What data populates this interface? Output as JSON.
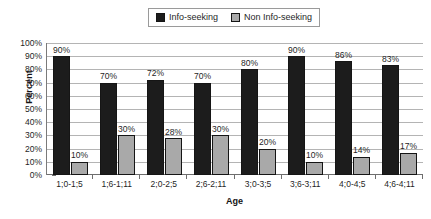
{
  "chart_data": {
    "type": "bar",
    "title": "",
    "xlabel": "Age",
    "ylabel": "Percent",
    "ylim": [
      0,
      100
    ],
    "grid": true,
    "legend_position": "top",
    "categories": [
      "1;0-1;5",
      "1;6-1;11",
      "2;0-2;5",
      "2;6-2;11",
      "3;0-3;5",
      "3;6-3;11",
      "4;0-4;5",
      "4;6-4;11"
    ],
    "ytick_labels": [
      "100%",
      "90%",
      "80%",
      "70%",
      "60%",
      "50%",
      "40%",
      "30%",
      "20%",
      "10%",
      "0%"
    ],
    "ytick_values": [
      100,
      90,
      80,
      70,
      60,
      50,
      40,
      30,
      20,
      10,
      0
    ],
    "series": [
      {
        "name": "Info-seeking",
        "color": "#1c1c1c",
        "values": [
          90,
          70,
          72,
          70,
          80,
          90,
          86,
          83
        ],
        "labels": [
          "90%",
          "70%",
          "72%",
          "70%",
          "80%",
          "90%",
          "86%",
          "83%"
        ]
      },
      {
        "name": "Non Info-seeking",
        "color": "#a9a9a9",
        "values": [
          10,
          30,
          28,
          30,
          20,
          10,
          14,
          17
        ],
        "labels": [
          "10%",
          "30%",
          "28%",
          "30%",
          "20%",
          "10%",
          "14%",
          "17%"
        ]
      }
    ]
  },
  "legend": {
    "items": [
      {
        "label": "Info-seeking",
        "swatch": "dark-square-swatch"
      },
      {
        "label": "Non Info-seeking",
        "swatch": "gray-square-swatch"
      }
    ]
  }
}
